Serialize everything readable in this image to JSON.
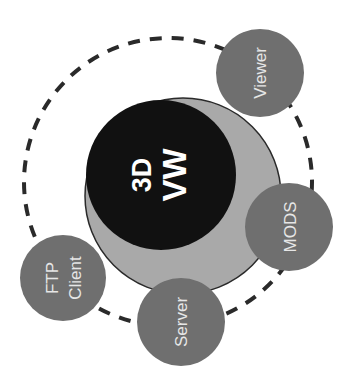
{
  "diagram": {
    "center": {
      "line1": "3D",
      "line2": "VW"
    },
    "satellites": [
      {
        "label": "Viewer"
      },
      {
        "label": "MODS"
      },
      {
        "label": "Server"
      },
      {
        "label": "FTP",
        "label2": "Client"
      }
    ],
    "colors": {
      "center_fill": "#111111",
      "ring_fill": "#a9a9a9",
      "satellite_fill": "#6f6f6f",
      "satellite_text": "#e6e6e6",
      "dashed_orbit": "#2a2a2a"
    }
  }
}
